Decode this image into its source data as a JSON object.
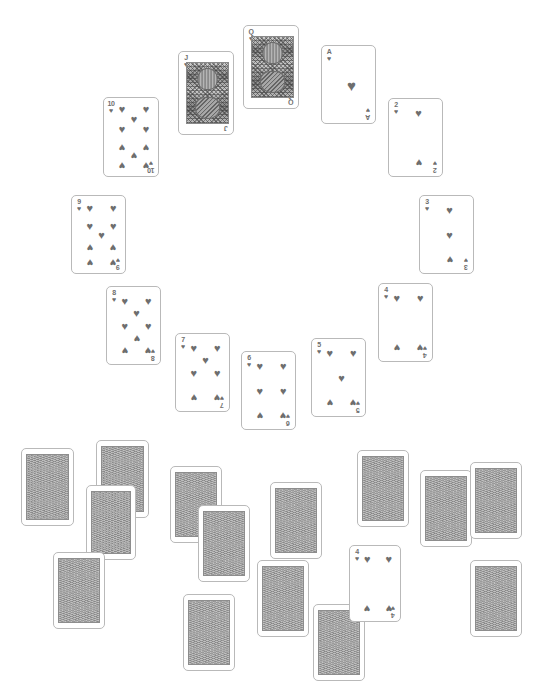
{
  "app": {
    "title": "Solitaire card board",
    "background_color": "#ffffff",
    "width": 538,
    "height": 694
  },
  "style": {
    "ink_color": "#6e6e6e",
    "card_border_color": "#b9b9b9",
    "card_face_color": "#ffffff",
    "card_back_color": "#9b9b9b",
    "card_back_border_color": "#8d8d8d"
  },
  "glyphs": {
    "heart": "♥",
    "spade": "♠"
  },
  "board": {
    "fan_label": "heart-fan-arc",
    "stock_label": "scattered-face-down-cards"
  },
  "fan_cards": [
    {
      "id": "ten-hearts",
      "rank": "10",
      "suit": "heart",
      "suit_glyph": "♥",
      "x": 103,
      "y": 97,
      "w": 56,
      "h": 80,
      "rot": 0,
      "layout": "ten"
    },
    {
      "id": "jack-hearts",
      "rank": "J",
      "suit": "heart",
      "suit_glyph": "♥",
      "x": 178,
      "y": 51,
      "w": 56,
      "h": 84,
      "rot": 0,
      "layout": "court"
    },
    {
      "id": "queen-hearts",
      "rank": "Q",
      "suit": "heart",
      "suit_glyph": "♥",
      "x": 243,
      "y": 25,
      "w": 56,
      "h": 84,
      "rot": 0,
      "layout": "court"
    },
    {
      "id": "ace-hearts",
      "rank": "A",
      "suit": "heart",
      "suit_glyph": "♥",
      "x": 321,
      "y": 45,
      "w": 55,
      "h": 79,
      "rot": 0,
      "layout": "ace"
    },
    {
      "id": "two-hearts",
      "rank": "2",
      "suit": "heart",
      "suit_glyph": "♥",
      "x": 388,
      "y": 98,
      "w": 55,
      "h": 79,
      "rot": 0,
      "layout": "two"
    },
    {
      "id": "three-hearts",
      "rank": "3",
      "suit": "heart",
      "suit_glyph": "♥",
      "x": 419,
      "y": 195,
      "w": 55,
      "h": 79,
      "rot": 0,
      "layout": "three"
    },
    {
      "id": "four-hearts-fan",
      "rank": "4",
      "suit": "heart",
      "suit_glyph": "♥",
      "x": 378,
      "y": 283,
      "w": 55,
      "h": 79,
      "rot": 0,
      "layout": "four"
    },
    {
      "id": "five-hearts",
      "rank": "5",
      "suit": "heart",
      "suit_glyph": "♥",
      "x": 311,
      "y": 338,
      "w": 55,
      "h": 79,
      "rot": 0,
      "layout": "five"
    },
    {
      "id": "six-hearts",
      "rank": "6",
      "suit": "heart",
      "suit_glyph": "♥",
      "x": 241,
      "y": 351,
      "w": 55,
      "h": 79,
      "rot": 0,
      "layout": "six"
    },
    {
      "id": "seven-hearts",
      "rank": "7",
      "suit": "heart",
      "suit_glyph": "♥",
      "x": 175,
      "y": 333,
      "w": 55,
      "h": 79,
      "rot": 0,
      "layout": "seven"
    },
    {
      "id": "eight-hearts",
      "rank": "8",
      "suit": "heart",
      "suit_glyph": "♥",
      "x": 106,
      "y": 286,
      "w": 55,
      "h": 79,
      "rot": 0,
      "layout": "eight"
    },
    {
      "id": "nine-hearts",
      "rank": "9",
      "suit": "heart",
      "suit_glyph": "♥",
      "x": 71,
      "y": 195,
      "w": 55,
      "h": 79,
      "rot": 0,
      "layout": "nine"
    }
  ],
  "loose_face_up_cards": [
    {
      "id": "four-hearts-loose",
      "rank": "4",
      "suit": "heart",
      "suit_glyph": "♥",
      "x": 349,
      "y": 545,
      "w": 52,
      "h": 77,
      "rot": 0,
      "layout": "four"
    }
  ],
  "face_down_cards": [
    {
      "id": "back-01",
      "x": 21,
      "y": 448,
      "w": 53,
      "h": 78,
      "rot": 0
    },
    {
      "id": "back-02",
      "x": 96,
      "y": 440,
      "w": 53,
      "h": 78,
      "rot": 0
    },
    {
      "id": "back-03",
      "x": 86,
      "y": 485,
      "w": 50,
      "h": 75,
      "rot": 0
    },
    {
      "id": "back-04",
      "x": 53,
      "y": 552,
      "w": 52,
      "h": 77,
      "rot": 0
    },
    {
      "id": "back-05",
      "x": 170,
      "y": 466,
      "w": 52,
      "h": 77,
      "rot": 0
    },
    {
      "id": "back-06",
      "x": 198,
      "y": 505,
      "w": 52,
      "h": 77,
      "rot": 0
    },
    {
      "id": "back-07",
      "x": 183,
      "y": 594,
      "w": 52,
      "h": 77,
      "rot": 0
    },
    {
      "id": "back-08",
      "x": 270,
      "y": 482,
      "w": 52,
      "h": 77,
      "rot": 0
    },
    {
      "id": "back-09",
      "x": 257,
      "y": 560,
      "w": 52,
      "h": 77,
      "rot": 0
    },
    {
      "id": "back-10",
      "x": 313,
      "y": 604,
      "w": 52,
      "h": 77,
      "rot": 0
    },
    {
      "id": "back-11",
      "x": 357,
      "y": 450,
      "w": 52,
      "h": 77,
      "rot": 0
    },
    {
      "id": "back-12",
      "x": 420,
      "y": 470,
      "w": 52,
      "h": 77,
      "rot": 0
    },
    {
      "id": "back-13",
      "x": 470,
      "y": 462,
      "w": 52,
      "h": 77,
      "rot": 0
    },
    {
      "id": "back-14",
      "x": 470,
      "y": 560,
      "w": 52,
      "h": 77,
      "rot": 0
    }
  ]
}
